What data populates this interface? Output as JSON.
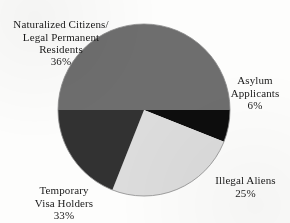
{
  "chart_data": {
    "type": "pie",
    "title": "",
    "subtitle": "",
    "xlabel": "",
    "ylabel": "",
    "legend_position": "none",
    "grid": false,
    "units": "percent",
    "total": 100,
    "categories": [
      "Naturalized Citizens/Legal Permanent Residents",
      "Asylum Applicants",
      "Illegal Aliens",
      "Temporary Visa Holders"
    ],
    "values": [
      36,
      6,
      25,
      33
    ],
    "slices": [
      {
        "name": "naturalized-citizens",
        "label": "Naturalized Citizens/\nLegal Permanent\nResidents",
        "percent_text": "36%",
        "value": 36,
        "color": "#6e6e6e",
        "start_angle": 270,
        "end_angle": 90
      },
      {
        "name": "asylum-applicants",
        "label": "Asylum\nApplicants",
        "percent_text": "6%",
        "value": 6,
        "color": "#0d0d0d",
        "start_angle": 90,
        "end_angle": 111.6
      },
      {
        "name": "illegal-aliens",
        "label": "Illegal Aliens",
        "percent_text": "25%",
        "value": 25,
        "color": "#dcdcdc",
        "start_angle": 111.6,
        "end_angle": 201.6
      },
      {
        "name": "temporary-visa-holders",
        "label": "Temporary\nVisa Holders",
        "percent_text": "33%",
        "value": 33,
        "color": "#323232",
        "start_angle": 201.6,
        "end_angle": 270
      }
    ],
    "geometry": {
      "center_x": 144,
      "center_y": 110,
      "radius": 86
    },
    "colors": {
      "naturalized": "#6e6e6e",
      "asylum": "#0d0d0d",
      "illegal": "#dcdcdc",
      "temporary": "#323232",
      "outline": "#8a8a8a",
      "background": "#fdfdfc",
      "text": "#1a1a1a"
    }
  }
}
